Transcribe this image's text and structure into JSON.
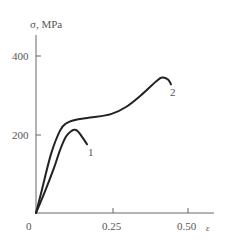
{
  "chart_data": {
    "type": "line",
    "title": "",
    "xlabel": "ε",
    "ylabel": "σ, MPa",
    "xlim": [
      0,
      0.58
    ],
    "ylim": [
      0,
      450
    ],
    "x_ticks": [
      "0.25",
      "0.50"
    ],
    "x_origin_label": "0",
    "y_ticks": [
      "200",
      "400"
    ],
    "grid": false,
    "legend": "inline curve labels",
    "series": [
      {
        "name": "1",
        "x": [
          0.0,
          0.03,
          0.06,
          0.08,
          0.1,
          0.12,
          0.13,
          0.14,
          0.15,
          0.16,
          0.17
        ],
        "y": [
          0,
          55,
          115,
          160,
          195,
          210,
          212,
          208,
          198,
          187,
          175
        ]
      },
      {
        "name": "2",
        "x": [
          0.0,
          0.02,
          0.05,
          0.08,
          0.1,
          0.13,
          0.18,
          0.25,
          0.3,
          0.35,
          0.4,
          0.42,
          0.44,
          0.45
        ],
        "y": [
          0,
          60,
          150,
          210,
          228,
          237,
          243,
          252,
          270,
          300,
          335,
          345,
          340,
          328
        ]
      }
    ]
  },
  "labels": {
    "y_axis": "σ, MPa",
    "x_axis": "ε",
    "origin": "0",
    "y400": "400",
    "y200": "200",
    "x025": "0.25",
    "x050": "0.50",
    "curve1": "1",
    "curve2": "2"
  },
  "colors": {
    "axis": "#555555",
    "curve": "#222222"
  }
}
